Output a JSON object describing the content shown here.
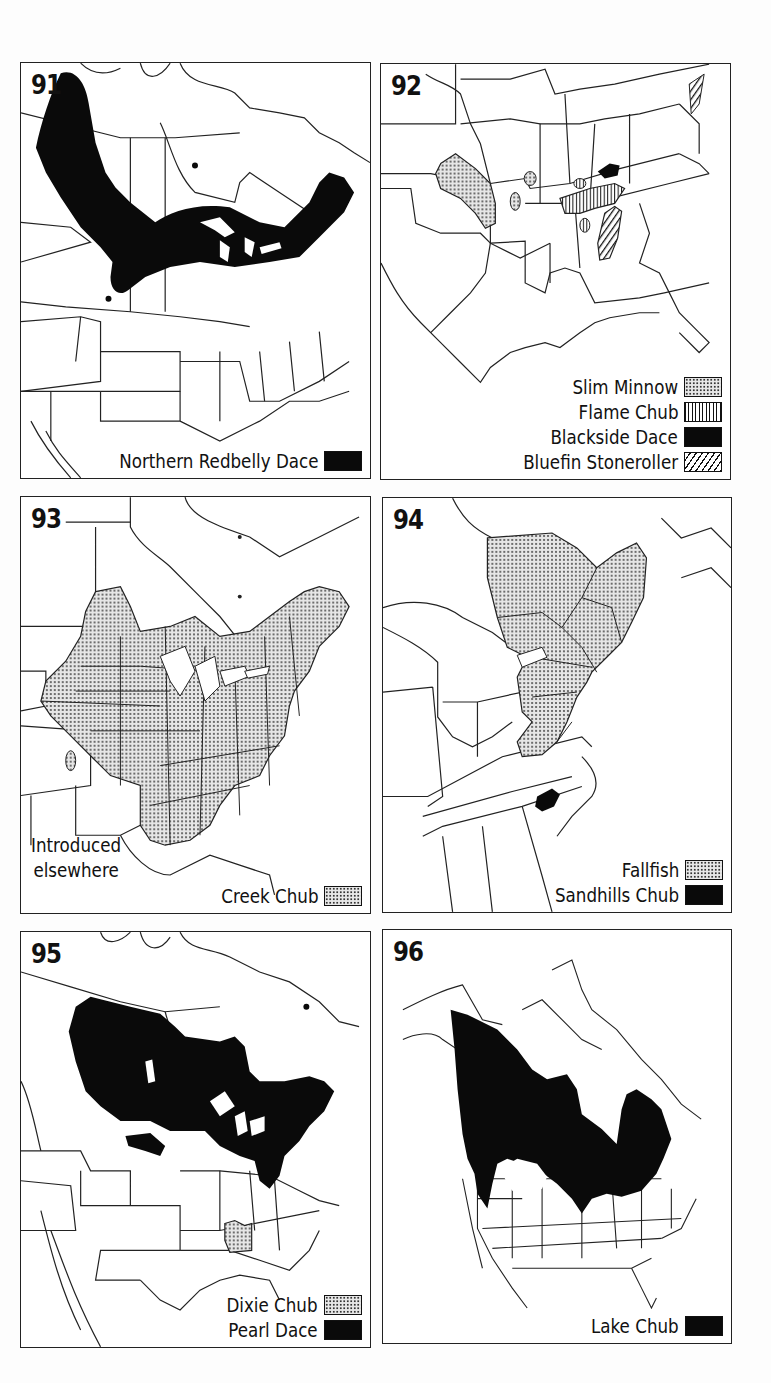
{
  "figure": {
    "panels": [
      {
        "number": "91",
        "region": "North America (northern)",
        "legend": [
          {
            "label": "Northern Redbelly Dace",
            "pattern": "solid"
          }
        ]
      },
      {
        "number": "92",
        "region": "Southeastern United States",
        "legend": [
          {
            "label": "Slim Minnow",
            "pattern": "dots"
          },
          {
            "label": "Flame Chub",
            "pattern": "vertical-lines"
          },
          {
            "label": "Blackside Dace",
            "pattern": "solid"
          },
          {
            "label": "Bluefin Stoneroller",
            "pattern": "diagonal-lines"
          }
        ]
      },
      {
        "number": "93",
        "region": "Eastern North America",
        "note": [
          "Introduced",
          "elsewhere"
        ],
        "legend": [
          {
            "label": "Creek Chub",
            "pattern": "dots"
          }
        ]
      },
      {
        "number": "94",
        "region": "Northeastern United States",
        "legend": [
          {
            "label": "Fallfish",
            "pattern": "dots"
          },
          {
            "label": "Sandhills Chub",
            "pattern": "solid"
          }
        ]
      },
      {
        "number": "95",
        "region": "North America",
        "legend": [
          {
            "label": "Dixie Chub",
            "pattern": "dots"
          },
          {
            "label": "Pearl Dace",
            "pattern": "solid"
          }
        ]
      },
      {
        "number": "96",
        "region": "North America (full)",
        "legend": [
          {
            "label": "Lake Chub",
            "pattern": "solid"
          }
        ]
      }
    ]
  },
  "colors": {
    "range_fill": "#0a0a0a",
    "outline": "#222222",
    "background": "#ffffff"
  }
}
